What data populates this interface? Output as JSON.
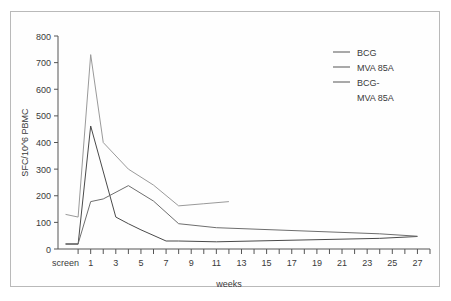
{
  "figure": {
    "frame": true,
    "background": "#ffffff"
  },
  "chart_data": {
    "type": "line",
    "title": "",
    "xlabel": "weeks",
    "ylabel": "SFC/10^6 PBMC",
    "xlim": [
      -1.6,
      28
    ],
    "ylim": [
      0,
      800
    ],
    "ytick_values": [
      0,
      100,
      200,
      300,
      400,
      500,
      600,
      700,
      800
    ],
    "ytick_labels": [
      "0",
      "100",
      "200",
      "300",
      "400",
      "500",
      "600",
      "700",
      "800"
    ],
    "xtick_values": [
      -1,
      0,
      1,
      2,
      3,
      4,
      5,
      6,
      7,
      8,
      9,
      10,
      11,
      12,
      13,
      14,
      15,
      16,
      17,
      18,
      19,
      20,
      21,
      22,
      23,
      24,
      25,
      26,
      27,
      28
    ],
    "xtick_labels": [
      "screen",
      "",
      "1",
      "",
      "3",
      "",
      "5",
      "",
      "7",
      "",
      "9",
      "",
      "11",
      "",
      "13",
      "",
      "15",
      "",
      "17",
      "",
      "19",
      "",
      "21",
      "",
      "23",
      "",
      "25",
      "",
      "27",
      ""
    ],
    "grid": false,
    "legend_position": "upper right",
    "series": [
      {
        "name": "BCG",
        "color": "#4a4a4a",
        "width": 1,
        "x": [
          -1,
          0,
          1,
          3,
          4,
          5,
          7,
          8,
          11,
          24,
          27
        ],
        "y": [
          18,
          18,
          462,
          120,
          95,
          72,
          30,
          30,
          27,
          40,
          47
        ]
      },
      {
        "name": "MVA 85A",
        "color": "#6e6e6e",
        "width": 1,
        "x": [
          -1,
          0,
          1,
          2,
          4,
          6,
          8,
          11,
          24,
          27
        ],
        "y": [
          20,
          20,
          178,
          188,
          238,
          180,
          95,
          80,
          57,
          48
        ]
      },
      {
        "name": "BCG-MVA 85A",
        "color": "#9a9a9a",
        "width": 1,
        "x": [
          -1,
          0,
          1,
          2,
          4,
          6,
          8,
          10,
          12
        ],
        "y": [
          130,
          120,
          730,
          400,
          300,
          240,
          162,
          170,
          178
        ]
      }
    ]
  },
  "legend": {
    "entries": [
      {
        "label": "BCG",
        "color": "#4a4a4a"
      },
      {
        "label": "MVA 85A",
        "color": "#6e6e6e"
      },
      {
        "label": "BCG-",
        "color": "#9a9a9a"
      },
      {
        "label": "MVA 85A",
        "color": "#9a9a9a"
      }
    ]
  }
}
